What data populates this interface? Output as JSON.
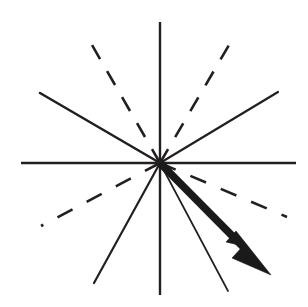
{
  "figure": {
    "canvas": {
      "width": 308,
      "height": 307,
      "background": "#ffffff"
    },
    "ink_color": "#231f20",
    "vector_color": "#1a1a1a",
    "origin": {
      "x": 160,
      "y": 163
    },
    "axes": {
      "horizontal": {
        "label": "horizontal-axis",
        "x1": 21,
        "y1": 163,
        "x2": 296,
        "y2": 163,
        "stroke_width": 2.4,
        "style": "solid"
      },
      "vertical": {
        "label": "vertical-axis",
        "x1": 160,
        "y1": 22,
        "x2": 160,
        "y2": 295,
        "stroke_width": 2.4,
        "style": "solid"
      }
    },
    "solid_rays": [
      {
        "name": "ray-upper-left",
        "angle_deg": 150,
        "x1": 160,
        "y1": 163,
        "x2": 40,
        "y2": 93,
        "stroke_width": 2.6
      },
      {
        "name": "ray-upper-right",
        "angle_deg": 30,
        "x1": 160,
        "y1": 163,
        "x2": 278,
        "y2": 92,
        "stroke_width": 2.2
      },
      {
        "name": "ray-lower-left",
        "angle_deg": 240,
        "x1": 160,
        "y1": 163,
        "x2": 94,
        "y2": 283,
        "stroke_width": 2.2
      },
      {
        "name": "ray-lower-right",
        "angle_deg": -64,
        "x1": 160,
        "y1": 163,
        "x2": 228,
        "y2": 291,
        "stroke_width": 1.7
      }
    ],
    "dashed_rays": [
      {
        "name": "dashed-ray-upper-left",
        "angle_deg": 120,
        "x1": 160,
        "y1": 163,
        "x2": 92,
        "y2": 45,
        "stroke_width": 2.6,
        "dash_pattern": "16 14"
      },
      {
        "name": "dashed-ray-upper-right",
        "angle_deg": 60,
        "x1": 160,
        "y1": 163,
        "x2": 229,
        "y2": 45,
        "stroke_width": 2.6,
        "dash_pattern": "16 14"
      },
      {
        "name": "dashed-ray-lower-left",
        "angle_deg": 207,
        "x1": 160,
        "y1": 163,
        "x2": 41,
        "y2": 226,
        "stroke_width": 2.6,
        "dash_pattern": "17 16"
      },
      {
        "name": "dashed-ray-lower-right",
        "angle_deg": -23,
        "x1": 160,
        "y1": 163,
        "x2": 287,
        "y2": 217,
        "stroke_width": 2.6,
        "dash_pattern": "17 16"
      }
    ],
    "vector": {
      "name": "resultant-vector",
      "angle_deg": -41,
      "tail": {
        "x": 160,
        "y": 163
      },
      "tip": {
        "x": 271,
        "y": 275
      },
      "shaft_width": 7.5,
      "head_points": "271,275 232,258 243,246 226,242 236,231"
    }
  }
}
